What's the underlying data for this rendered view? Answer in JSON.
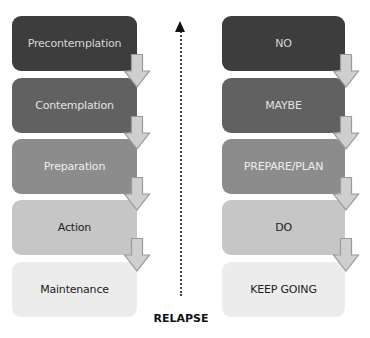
{
  "stages": [
    {
      "label": "Precontemplation",
      "meaning": "NO",
      "bg": "#3d3d3d",
      "fg": "#d8d8d8"
    },
    {
      "label": "Contemplation",
      "meaning": "MAYBE",
      "bg": "#616161",
      "fg": "#e2e2e2"
    },
    {
      "label": "Preparation",
      "meaning": "PREPARE/PLAN",
      "bg": "#8c8c8c",
      "fg": "#eeeeee"
    },
    {
      "label": "Action",
      "meaning": "DO",
      "bg": "#c6c6c6",
      "fg": "#222222"
    },
    {
      "label": "Maintenance",
      "meaning": "KEEP GOING",
      "bg": "#ececec",
      "fg": "#222222"
    }
  ],
  "relapse": {
    "label": "RELAPSE",
    "direction": "up"
  },
  "arrow_colors": {
    "fill": "#cfcfcf",
    "stroke": "#9a9a9a"
  }
}
